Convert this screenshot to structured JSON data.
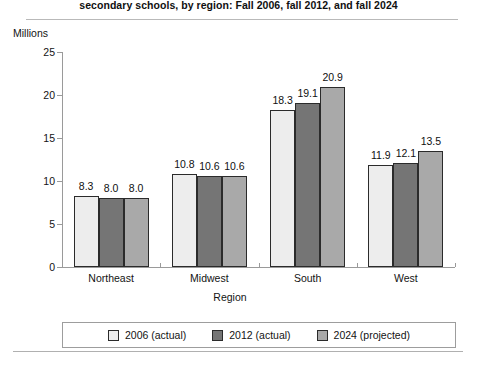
{
  "chart_data": {
    "type": "bar",
    "title": "secondary schools, by region: Fall 2006, fall 2012, and fall 2024",
    "units_label": "Millions",
    "xlabel": "Region",
    "ylabel": "Millions",
    "ylim": [
      0,
      25
    ],
    "yticks": [
      25,
      20,
      15,
      10,
      5,
      0
    ],
    "ytick_labels": [
      "25",
      "20",
      "15",
      "10",
      "5",
      "0"
    ],
    "grid": false,
    "legend_position": "bottom",
    "categories": [
      "Northeast",
      "Midwest",
      "South",
      "West"
    ],
    "series": [
      {
        "name": "2006 (actual)",
        "color": "#ededed",
        "values": [
          8.3,
          10.8,
          18.3,
          11.9
        ],
        "labels": [
          "8.3",
          "10.8",
          "18.3",
          "11.9"
        ]
      },
      {
        "name": "2012 (actual)",
        "color": "#757575",
        "values": [
          8.0,
          10.6,
          19.1,
          12.1
        ],
        "labels": [
          "8.0",
          "10.6",
          "19.1",
          "12.1"
        ]
      },
      {
        "name": "2024 (projected)",
        "color": "#a9a9a9",
        "values": [
          8.0,
          10.6,
          20.9,
          13.5
        ],
        "labels": [
          "8.0",
          "10.6",
          "20.9",
          "13.5"
        ]
      }
    ]
  },
  "legend": {
    "items": [
      {
        "label": "2006 (actual)"
      },
      {
        "label": "2012 (actual)"
      },
      {
        "label": "2024 (projected)"
      }
    ]
  }
}
